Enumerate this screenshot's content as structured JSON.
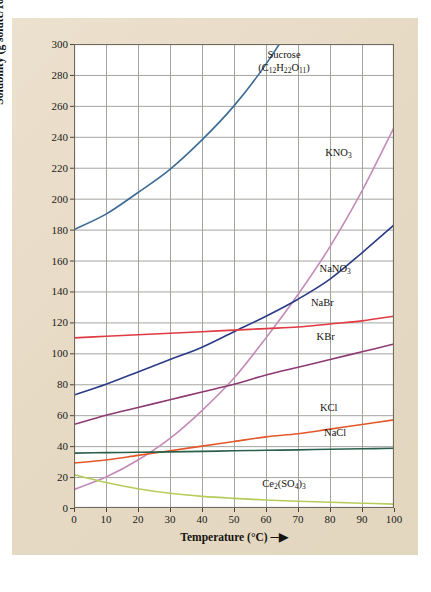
{
  "figure": {
    "panel_bg": "#e9ddc9",
    "plot_bg": "#ffffff",
    "grid_color": "#9a9a95",
    "frame_color": "#6e6a60"
  },
  "axes": {
    "y_title_html": "Solubility (g solute/100 g H<sub>2</sub>O) &#9472;&#9654;",
    "y_title_text": "Solubility (g solute/100 g H2O) →",
    "x_title_html": "Temperature (&deg;C) &#9472;&#9654;",
    "x_title_text": "Temperature (°C) →",
    "y_ticks": [
      0,
      20,
      40,
      60,
      80,
      100,
      120,
      140,
      160,
      180,
      200,
      220,
      240,
      260,
      280,
      300
    ],
    "x_ticks": [
      0,
      10,
      20,
      30,
      40,
      50,
      60,
      70,
      80,
      90,
      100
    ]
  },
  "chart_data": {
    "type": "line",
    "title": "",
    "xlabel": "Temperature (°C)",
    "ylabel": "Solubility (g solute/100 g H2O)",
    "xlim": [
      0,
      100
    ],
    "ylim": [
      0,
      300
    ],
    "grid": true,
    "legend": "inline-curve-labels",
    "x": [
      0,
      10,
      20,
      30,
      40,
      50,
      60,
      70,
      80,
      90,
      100
    ],
    "series": [
      {
        "name": "Sucrose",
        "label": "Sucrose",
        "label_sub": "(C12H22O11)",
        "formula_html": "(C<sub>12</sub>H<sub>22</sub>O<sub>11</sub>)",
        "color": "#3d6b96",
        "label_x": 60,
        "label_y": 290,
        "values": [
          180,
          190,
          204,
          219,
          238,
          260,
          287,
          320,
          362,
          415,
          487
        ],
        "clipped_at_top": true
      },
      {
        "name": "KNO3",
        "label": "KNO3",
        "label_html": "KNO<sub>3</sub>",
        "color": "#c48bb8",
        "label_x": 77,
        "label_y": 227,
        "values": [
          12,
          20,
          31,
          45,
          63,
          84,
          110,
          138,
          169,
          205,
          246
        ]
      },
      {
        "name": "NaNO3",
        "label": "NaNO3",
        "label_html": "NaNO<sub>3</sub>",
        "color": "#2b3b86",
        "label_x": 76,
        "label_y": 152,
        "values": [
          73,
          80,
          88,
          96,
          104,
          114,
          124,
          135,
          148,
          165,
          183
        ]
      },
      {
        "name": "NaBr",
        "label": "NaBr",
        "label_html": "NaBr",
        "color": "#e03a42",
        "label_x": 72,
        "label_y": 130,
        "values": [
          110,
          111,
          112,
          113,
          114,
          115,
          116,
          117,
          119,
          121,
          124
        ]
      },
      {
        "name": "KBr",
        "label": "KBr",
        "label_html": "KBr",
        "color": "#8e3a72",
        "label_x": 73,
        "label_y": 108,
        "values": [
          54,
          60,
          65,
          70,
          75,
          80,
          86,
          91,
          96,
          101,
          106
        ]
      },
      {
        "name": "KCl",
        "label": "KCl",
        "label_html": "KCl",
        "color": "#e2582a",
        "label_x": 74,
        "label_y": 62,
        "values": [
          29,
          31,
          34,
          37,
          40,
          43,
          46,
          48,
          51,
          54,
          57
        ]
      },
      {
        "name": "NaCl",
        "label": "NaCl",
        "label_html": "NaCl",
        "color": "#2a5f4a",
        "label_x": 76,
        "label_y": 46,
        "values": [
          35.5,
          35.8,
          36.0,
          36.3,
          36.6,
          37.0,
          37.3,
          37.6,
          38.0,
          38.3,
          38.6
        ]
      },
      {
        "name": "Ce2(SO4)3",
        "label": "Ce2(SO4)3",
        "label_html": "Ce<sub>2</sub>(SO<sub>4</sub>)<sub>3</sub>",
        "color": "#b5cc5a",
        "label_x": 60,
        "label_y": 13,
        "values": [
          21.5,
          16.5,
          12.5,
          9.5,
          7.5,
          6.2,
          5.2,
          4.4,
          3.7,
          3.1,
          2.5
        ]
      }
    ]
  }
}
